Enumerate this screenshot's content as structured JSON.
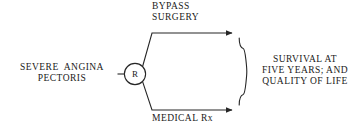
{
  "diagram": {
    "source": {
      "label": "SEVERE  ANGINA\nPECTORIS",
      "name": "source-population-label"
    },
    "randomization_node": {
      "letter": "R",
      "name": "randomization-node"
    },
    "branches": [
      {
        "id": "top",
        "label": "BYPASS\nSURGERY",
        "name": "branch-label-bypass-surgery"
      },
      {
        "id": "bottom",
        "label": "MEDICAL Rx",
        "name": "branch-label-medical-rx"
      }
    ],
    "outcome": {
      "label": "SURVIVAL AT\nFIVE YEARS; AND\nQUALITY OF LIFE",
      "name": "outcome-label"
    },
    "style": {
      "stroke": "#262626",
      "background": "#ffffff",
      "text": "#1a1a1a"
    }
  }
}
